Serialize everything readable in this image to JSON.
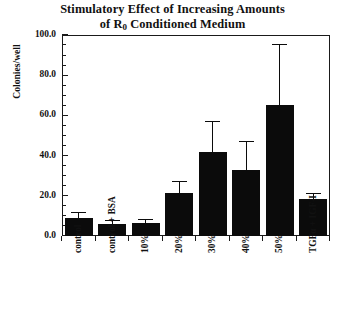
{
  "chart_data": {
    "type": "bar",
    "title": "Stimulatory Effect of Increasing Amounts of R0 Conditioned Medium",
    "title_line1": "Stimulatory Effect of Increasing Amounts",
    "title_line2_pre": "of R",
    "title_line2_sub": "0",
    "title_line2_post": " Conditioned Medium",
    "xlabel": "",
    "ylabel": "Colonies/well",
    "ylim": [
      0,
      100
    ],
    "ytick_labels": [
      "100.0",
      "80.0",
      "60.0",
      "40.0",
      "20.0",
      "0.0"
    ],
    "ytick_values": [
      100,
      80,
      60,
      40,
      20,
      0
    ],
    "yminor_step": 5,
    "grid": false,
    "legend": "none",
    "bar_color": "#0b0b0b",
    "axis_color": "#1a1a1a",
    "categories": [
      "control",
      "control + BSA",
      "10%",
      "20%",
      "30%",
      "40%",
      "50%",
      "TGFα + IGF-I"
    ],
    "values": [
      9,
      6,
      6.5,
      21.5,
      42,
      33,
      65,
      18.5
    ],
    "errors": [
      2.5,
      1.5,
      1.5,
      5.5,
      15,
      14,
      30,
      2.5
    ],
    "error_type": "upper-only",
    "series": [
      {
        "name": "Colonies/well",
        "values": [
          9,
          6,
          6.5,
          21.5,
          42,
          33,
          65,
          18.5
        ],
        "errors": [
          2.5,
          1.5,
          1.5,
          5.5,
          15,
          14,
          30,
          2.5
        ]
      }
    ]
  }
}
